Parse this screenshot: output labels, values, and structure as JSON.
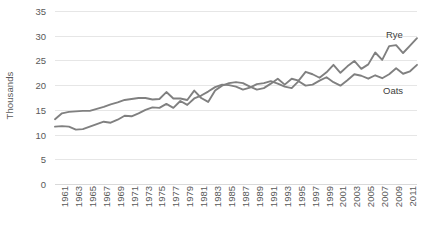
{
  "chart_data": {
    "type": "line",
    "title": "",
    "subtitle": "",
    "xlabel": "",
    "ylabel": "Thousands",
    "xlim": [
      1961,
      2013
    ],
    "ylim": [
      0,
      35
    ],
    "ytick_step": 5,
    "xtick_step": 2,
    "grid": true,
    "legend_position": "inline-right-labels",
    "series_color": "#808080",
    "gridline_color": "#E6E6E6",
    "axis_text_color": "#595959",
    "background": "#FFFFFF",
    "y_ticks": [
      0,
      5,
      10,
      15,
      20,
      25,
      30,
      35
    ],
    "x_ticks": [
      "1961",
      "1963",
      "1965",
      "1967",
      "1969",
      "1971",
      "1973",
      "1975",
      "1977",
      "1979",
      "1981",
      "1983",
      "1985",
      "1987",
      "1989",
      "1991",
      "1993",
      "1995",
      "1997",
      "1999",
      "2001",
      "2003",
      "2005",
      "2007",
      "2009",
      "2011",
      "2013"
    ],
    "x": [
      1961,
      1962,
      1963,
      1964,
      1965,
      1966,
      1967,
      1968,
      1969,
      1970,
      1971,
      1972,
      1973,
      1974,
      1975,
      1976,
      1977,
      1978,
      1979,
      1980,
      1981,
      1982,
      1983,
      1984,
      1985,
      1986,
      1987,
      1988,
      1989,
      1990,
      1991,
      1992,
      1993,
      1994,
      1995,
      1996,
      1997,
      1998,
      1999,
      2000,
      2001,
      2002,
      2003,
      2004,
      2005,
      2006,
      2007,
      2008,
      2009,
      2010,
      2011,
      2012,
      2013
    ],
    "series": [
      {
        "name": "Rye",
        "label": "Rye",
        "color": "#808080",
        "values": [
          13.1,
          14.3,
          14.6,
          14.7,
          14.8,
          14.8,
          15.2,
          15.6,
          16.1,
          16.5,
          17.0,
          17.2,
          17.4,
          17.4,
          17.1,
          17.2,
          18.6,
          17.3,
          17.3,
          17.0,
          18.9,
          17.4,
          16.6,
          18.9,
          19.9,
          20.4,
          20.6,
          20.4,
          19.7,
          19.1,
          19.4,
          20.3,
          21.3,
          20.1,
          21.3,
          20.9,
          22.7,
          22.2,
          21.5,
          22.6,
          24.1,
          22.5,
          23.8,
          24.9,
          23.3,
          24.2,
          26.6,
          25.1,
          27.9,
          28.1,
          26.5,
          28.0,
          29.5
        ]
      },
      {
        "name": "Oats",
        "label": "Oats",
        "color": "#808080",
        "values": [
          11.6,
          11.7,
          11.6,
          11.0,
          11.1,
          11.6,
          12.1,
          12.6,
          12.4,
          13.0,
          13.8,
          13.7,
          14.3,
          15.0,
          15.5,
          15.4,
          16.2,
          15.4,
          16.8,
          16.0,
          17.3,
          17.9,
          18.7,
          19.6,
          20.1,
          20.0,
          19.7,
          19.1,
          19.5,
          20.2,
          20.4,
          20.8,
          20.3,
          19.7,
          19.4,
          20.8,
          19.9,
          20.1,
          20.9,
          21.6,
          20.6,
          19.9,
          21.0,
          22.2,
          21.9,
          21.3,
          22.0,
          21.4,
          22.2,
          23.4,
          22.3,
          22.8,
          24.1
        ]
      }
    ]
  }
}
